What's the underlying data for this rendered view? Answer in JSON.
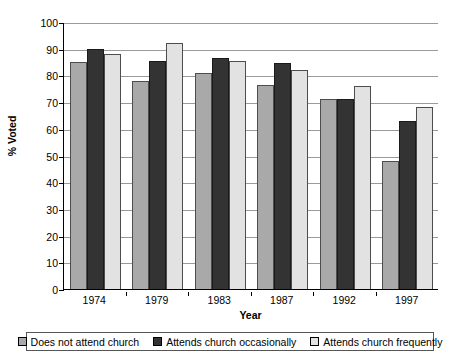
{
  "chart_data": {
    "type": "bar",
    "title": "",
    "xlabel": "Year",
    "ylabel": "% Voted",
    "ylim": [
      0,
      100
    ],
    "ytick_step": 10,
    "yticks": [
      0,
      10,
      20,
      30,
      40,
      50,
      60,
      70,
      80,
      90,
      100
    ],
    "grid": true,
    "legend_position": "bottom",
    "categories": [
      "1974",
      "1979",
      "1983",
      "1987",
      "1992",
      "1997"
    ],
    "series": [
      {
        "name": "Does not attend church",
        "color": "#a9a9a9",
        "values": [
          85,
          78,
          81,
          76.5,
          71,
          48
        ]
      },
      {
        "name": "Attends church occasionally",
        "color": "#333333",
        "values": [
          90,
          85.5,
          86.5,
          84.5,
          71,
          63
        ]
      },
      {
        "name": "Attends church frequently",
        "color": "#e2e2e2",
        "values": [
          88,
          92,
          85.5,
          82,
          76,
          68
        ]
      }
    ]
  },
  "axis": {
    "y_title": "% Voted",
    "x_title": "Year"
  }
}
